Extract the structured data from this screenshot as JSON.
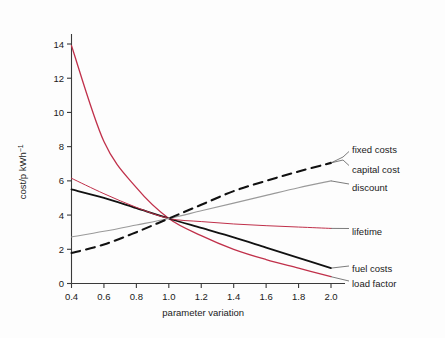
{
  "chart_data": {
    "type": "line",
    "title": "",
    "xlabel": "parameter variation",
    "ylabel": "cost/p kWh⁻¹",
    "xlim": [
      0.3,
      2.1
    ],
    "ylim": [
      0,
      15
    ],
    "grid": false,
    "legend_position": "right-inline-labels",
    "xticks": [
      "0.4",
      "0.6",
      "0.8",
      "1.0",
      "1.2",
      "1.4",
      "1.6",
      "1.8",
      "2.0"
    ],
    "xtick_values": [
      0.4,
      0.6,
      0.8,
      1.0,
      1.2,
      1.4,
      1.6,
      1.8,
      2.0
    ],
    "yticks": [
      "0",
      "2",
      "4",
      "6",
      "8",
      "10",
      "12",
      "14"
    ],
    "ytick_values": [
      0,
      2,
      4,
      6,
      8,
      10,
      12,
      14
    ],
    "x": [
      0.4,
      0.6,
      0.8,
      1.0,
      1.2,
      1.4,
      1.6,
      1.8,
      2.0
    ],
    "series": [
      {
        "name": "load factor",
        "label": "load factor",
        "color": "#c0304a",
        "style": "solid",
        "width": 1.3,
        "values": [
          13.9,
          8.3,
          5.6,
          3.8,
          2.8,
          2.0,
          1.4,
          0.9,
          0.4
        ]
      },
      {
        "name": "fuel costs",
        "label": "fuel costs",
        "color": "#111111",
        "style": "solid",
        "width": 1.8,
        "values": [
          5.5,
          5.0,
          4.4,
          3.8,
          3.25,
          2.7,
          2.1,
          1.5,
          0.9
        ]
      },
      {
        "name": "lifetime",
        "label": "lifetime",
        "color": "#c0304a",
        "style": "solid",
        "width": 1.0,
        "values": [
          6.15,
          5.25,
          4.45,
          3.8,
          3.62,
          3.48,
          3.38,
          3.3,
          3.22
        ]
      },
      {
        "name": "discount",
        "label": "discount",
        "color": "#9a9a9a",
        "style": "solid",
        "width": 1.1,
        "values": [
          2.72,
          3.05,
          3.42,
          3.8,
          4.25,
          4.7,
          5.15,
          5.6,
          6.0
        ]
      },
      {
        "name": "capital cost",
        "label": "capital cost",
        "color": "#111111",
        "style": "dashed",
        "width": 2.1,
        "values": [
          1.78,
          2.28,
          3.0,
          3.8,
          4.6,
          5.4,
          6.0,
          6.55,
          7.05
        ]
      }
    ],
    "annotations": [
      {
        "name": "fixed costs",
        "text": "fixed costs",
        "target_series": "capital cost"
      },
      {
        "name": "capital cost",
        "text": "capital cost",
        "target_series": "capital cost"
      },
      {
        "name": "discount",
        "text": "discount",
        "target_series": "discount"
      },
      {
        "name": "lifetime",
        "text": "lifetime",
        "target_series": "lifetime"
      },
      {
        "name": "fuel costs",
        "text": "fuel costs",
        "target_series": "fuel costs"
      },
      {
        "name": "load factor",
        "text": "load factor",
        "target_series": "load factor"
      }
    ]
  },
  "labels": {
    "fixed_costs": "fixed costs",
    "capital_cost": "capital cost",
    "discount": "discount",
    "lifetime": "lifetime",
    "fuel_costs": "fuel costs",
    "load_factor": "load factor",
    "x_axis_title": "parameter variation",
    "y_axis_title": "cost/p kWh⁻¹"
  },
  "colors": {
    "red": "#c0304a",
    "black": "#111111",
    "gray": "#9a9a9a",
    "axis": "#3a3a3a",
    "background": "#fdfdfd"
  }
}
